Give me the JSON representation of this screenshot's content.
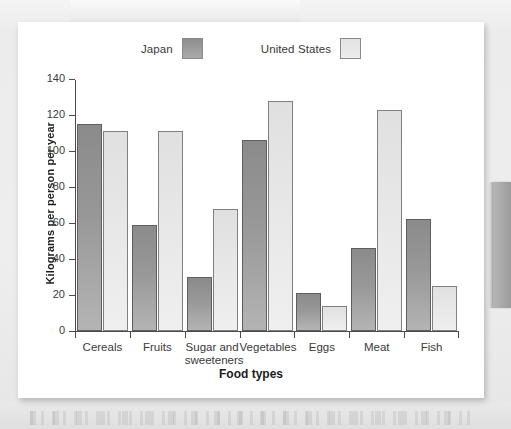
{
  "chart_data": {
    "type": "bar",
    "title": "",
    "xlabel": "Food types",
    "ylabel": "Kilograms per person per year",
    "ylim": [
      0,
      140
    ],
    "yticks": [
      0,
      20,
      40,
      60,
      80,
      100,
      120,
      140
    ],
    "grid": false,
    "legend_position": "top-center",
    "categories": [
      "Cereals",
      "Fruits",
      "Sugar and\nsweeteners",
      "Vegetables",
      "Eggs",
      "Meat",
      "Fish"
    ],
    "series": [
      {
        "name": "Japan",
        "color": "#989898",
        "values": [
          115,
          59,
          30,
          106,
          21,
          46,
          62
        ]
      },
      {
        "name": "United States",
        "color": "#e5e5e5",
        "values": [
          111,
          111,
          68,
          128,
          14,
          123,
          25
        ]
      }
    ]
  },
  "legend": {
    "items": [
      {
        "label": "Japan",
        "swatch": "japan-swatch"
      },
      {
        "label": "United States",
        "swatch": "united-states-swatch"
      }
    ]
  },
  "axes": {
    "y_title": "Kilograms per person per year",
    "x_title": "Food types",
    "y_tick_labels": [
      "0",
      "20",
      "40",
      "60",
      "80",
      "100",
      "120",
      "140"
    ]
  }
}
